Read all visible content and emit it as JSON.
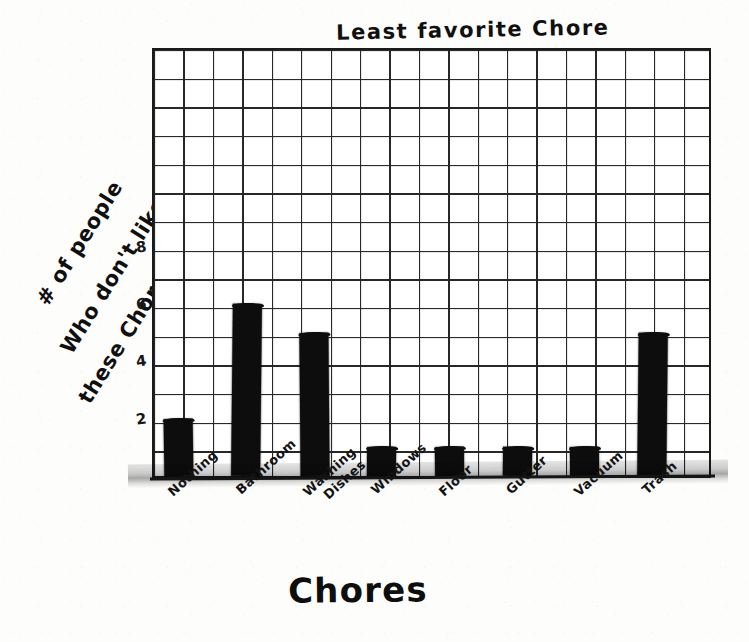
{
  "chart_data": {
    "type": "bar",
    "title": "Least favorite Chore",
    "xlabel": "Chores",
    "ylabel": "# of people Who don't like these Chores",
    "ylabel_lines": [
      "# of people",
      "Who don't like",
      "these Chores"
    ],
    "categories": [
      "Nothing",
      "Bathroom",
      "Washing Dishes",
      "Windows",
      "Floor",
      "Gutter",
      "Vacuum",
      "Trash"
    ],
    "category_lines": [
      [
        "Nothing"
      ],
      [
        "Bathroom"
      ],
      [
        "Washing",
        "Dishes"
      ],
      [
        "Windows"
      ],
      [
        "Floor"
      ],
      [
        "Gutter"
      ],
      [
        "Vacuum"
      ],
      [
        "Trash"
      ]
    ],
    "values": [
      2,
      6,
      5,
      1,
      1,
      1,
      1,
      5
    ],
    "ylim": [
      0,
      15
    ],
    "ytick_values": [
      2,
      4,
      6,
      8
    ],
    "ytick_labels": [
      "2",
      "4",
      "6",
      "8"
    ],
    "grid": true,
    "grid_rows": 15,
    "grid_cols": 19,
    "legend": false,
    "bar_color": "#0d0d0d",
    "style": "hand-drawn on graph paper"
  },
  "colors": {
    "ink": "#101010",
    "grid": "#2b2b2b",
    "paper": "#fdfdfc"
  }
}
